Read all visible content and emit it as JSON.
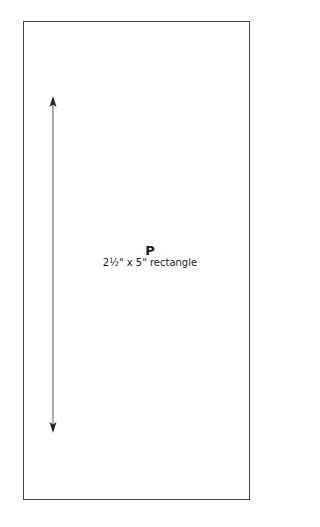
{
  "pattern_piece": {
    "letter": "P",
    "dimensions": "2½\" x 5\" rectangle"
  },
  "grainline": {
    "direction": "vertical",
    "arrowheads": "both ends"
  },
  "colors": {
    "outline": "#444444",
    "arrow": "#222222",
    "text": "#1a1a1a"
  }
}
